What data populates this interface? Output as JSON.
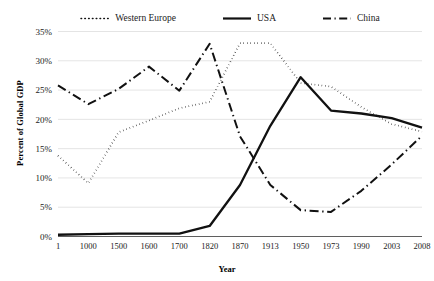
{
  "chart_data": {
    "type": "line",
    "title": "",
    "xlabel": "Year",
    "ylabel": "Percent of Global GDP",
    "categories": [
      "1",
      "1000",
      "1500",
      "1600",
      "1700",
      "1820",
      "1870",
      "1913",
      "1950",
      "1973",
      "1990",
      "2003",
      "2008"
    ],
    "ylim": [
      0,
      35
    ],
    "ytick_labels": [
      "0%",
      "5%",
      "10%",
      "15%",
      "20%",
      "25%",
      "30%",
      "35%"
    ],
    "ytick_values": [
      0,
      5,
      10,
      15,
      20,
      25,
      30,
      35
    ],
    "grid": true,
    "legend_position": "top",
    "series": [
      {
        "name": "Western Europe",
        "style": "dotted",
        "values": [
          13.8,
          9.1,
          17.8,
          19.8,
          21.9,
          23.0,
          33.0,
          33.0,
          26.2,
          25.6,
          22.1,
          19.2,
          17.9
        ]
      },
      {
        "name": "USA",
        "style": "solid",
        "values": [
          0.3,
          0.4,
          0.5,
          0.5,
          0.5,
          1.8,
          8.8,
          18.9,
          27.2,
          21.5,
          21.0,
          20.2,
          18.6
        ]
      },
      {
        "name": "China",
        "style": "dash-dot",
        "values": [
          25.8,
          22.6,
          25.2,
          29.0,
          24.9,
          32.9,
          17.1,
          8.8,
          4.5,
          4.2,
          7.8,
          12.3,
          17.2
        ]
      }
    ]
  },
  "legend": {
    "items": [
      {
        "label": "Western Europe",
        "swatch": "dotted-line-swatch"
      },
      {
        "label": "USA",
        "swatch": "solid-line-swatch"
      },
      {
        "label": "China",
        "swatch": "dash-dot-line-swatch"
      }
    ]
  },
  "axes": {
    "y_title": "Percent of Global GDP",
    "x_title": "Year"
  }
}
